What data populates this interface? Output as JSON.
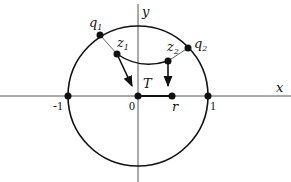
{
  "diagram": {
    "type": "unit-disk-mapping",
    "axes": {
      "x_label": "x",
      "y_label": "y"
    },
    "tick_labels": {
      "minus_one": "-1",
      "zero": "0",
      "one": "1",
      "r": "r"
    },
    "points": {
      "q1": {
        "label": "q",
        "sub": "1"
      },
      "q2": {
        "label": "q",
        "sub": "2"
      },
      "z1": {
        "label": "z",
        "sub": "1"
      },
      "z2": {
        "label": "z",
        "sub": "2"
      },
      "T": {
        "label": "T"
      }
    },
    "colors": {
      "stroke": "#111111",
      "thin_stroke": "#555555",
      "background": "#ffffff"
    }
  }
}
